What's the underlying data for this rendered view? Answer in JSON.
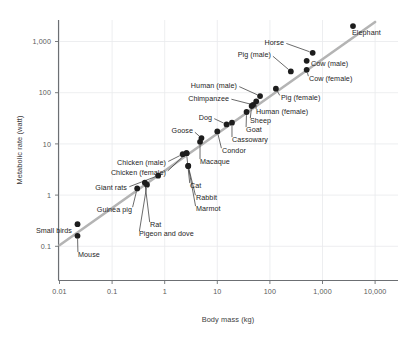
{
  "chart_data": {
    "type": "scatter",
    "title": "",
    "xlabel": "Body mass (kg)",
    "ylabel": "Metabolic rate (watt)",
    "xscale": "log",
    "yscale": "log",
    "xlim": [
      0.01,
      10000
    ],
    "ylim": [
      0.1,
      3000
    ],
    "grid": true,
    "legend": "none",
    "xticks": [
      "0.01",
      "0.1",
      "1",
      "10",
      "100",
      "1,000",
      "10,000"
    ],
    "xtick_values": [
      0.01,
      0.1,
      1,
      10,
      100,
      1000,
      10000
    ],
    "yticks": [
      "1,000",
      "100",
      "10",
      "1",
      "0.1"
    ],
    "ytick_values": [
      1000,
      100,
      10,
      1,
      0.1
    ],
    "trendline": {
      "description": "Kleiber's law power-law fit (slope 3/4 on log-log axes)",
      "x_start": 0.01,
      "y_start": 0.105,
      "x_end": 10000,
      "y_end": 2400
    },
    "points": [
      {
        "label": "Mouse",
        "x": 0.022,
        "y": 0.16,
        "label_side": "right"
      },
      {
        "label": "Small birds",
        "x": 0.022,
        "y": 0.27,
        "label_side": "left"
      },
      {
        "label": "Guinea pig",
        "x": 0.3,
        "y": 1.35,
        "label_side": "left"
      },
      {
        "label": "Rat",
        "x": 0.42,
        "y": 1.75,
        "label_side": "right"
      },
      {
        "label": "Pigeon and dove",
        "x": 0.46,
        "y": 1.6,
        "label_side": "right"
      },
      {
        "label": "Giant rats",
        "x": 0.75,
        "y": 2.4,
        "label_side": "left"
      },
      {
        "label": "Chicken (male)",
        "x": 2.2,
        "y": 6.3,
        "label_side": "left"
      },
      {
        "label": "Chicken (female)",
        "x": 2.6,
        "y": 6.6,
        "label_side": "left"
      },
      {
        "label": "Cat",
        "x": 2.6,
        "y": 6.6,
        "label_side": "right"
      },
      {
        "label": "Marmot",
        "x": 2.8,
        "y": 3.7,
        "label_side": "right"
      },
      {
        "label": "Rabbit",
        "x": 2.8,
        "y": 3.7,
        "label_side": "right"
      },
      {
        "label": "Goose",
        "x": 5.0,
        "y": 13.0,
        "label_side": "left"
      },
      {
        "label": "Macaque",
        "x": 4.7,
        "y": 11.0,
        "label_side": "right"
      },
      {
        "label": "Condor",
        "x": 10.0,
        "y": 17.5,
        "label_side": "right"
      },
      {
        "label": "Dog",
        "x": 15.0,
        "y": 24.0,
        "label_side": "left"
      },
      {
        "label": "Cassowary",
        "x": 19.0,
        "y": 26.0,
        "label_side": "right"
      },
      {
        "label": "Goat",
        "x": 36.0,
        "y": 42.0,
        "label_side": "right"
      },
      {
        "label": "Sheep",
        "x": 45.0,
        "y": 55.0,
        "label_side": "right"
      },
      {
        "label": "Chimpanzee",
        "x": 48.0,
        "y": 58.0,
        "label_side": "left"
      },
      {
        "label": "Human (female)",
        "x": 55.0,
        "y": 68.0,
        "label_side": "right"
      },
      {
        "label": "Human (male)",
        "x": 65.0,
        "y": 86.0,
        "label_side": "left"
      },
      {
        "label": "Pig (female)",
        "x": 130.0,
        "y": 120.0,
        "label_side": "right"
      },
      {
        "label": "Pig (male)",
        "x": 250.0,
        "y": 260.0,
        "label_side": "left"
      },
      {
        "label": "Cow (female)",
        "x": 500.0,
        "y": 280.0,
        "label_side": "right"
      },
      {
        "label": "Cow (male)",
        "x": 500.0,
        "y": 420.0,
        "label_side": "right"
      },
      {
        "label": "Horse",
        "x": 650.0,
        "y": 600.0,
        "label_side": "left"
      },
      {
        "label": "Elephant",
        "x": 3800.0,
        "y": 2000.0,
        "label_side": "right"
      }
    ]
  },
  "colors": {
    "dot": "#1d1d1d",
    "trendline": "#b4b4b4",
    "grid": "#e8eaec",
    "axis": "#6c6f73",
    "text": "#1e1e1e",
    "tick_text": "#5a5a5a",
    "background": "#ffffff"
  },
  "labels": {
    "x_axis_title": "Body mass (kg)",
    "y_axis_title": "Metabolic rate (watt)"
  },
  "annotations": {
    "mouse": "Mouse",
    "small_birds": "Small birds",
    "guinea_pig": "Guinea pig",
    "rat": "Rat",
    "pigeon_and_dove": "Pigeon and dove",
    "giant_rats": "Giant rats",
    "chicken_male": "Chicken (male)",
    "chicken_female": "Chicken (female)",
    "cat": "Cat",
    "rabbit": "Rabbit",
    "marmot": "Marmot",
    "goose": "Goose",
    "macaque": "Macaque",
    "condor": "Condor",
    "dog": "Dog",
    "cassowary": "Cassowary",
    "goat": "Goat",
    "sheep": "Sheep",
    "chimpanzee": "Chimpanzee",
    "human_female": "Human (female)",
    "human_male": "Human (male)",
    "pig_female": "Pig (female)",
    "pig_male": "Pig (male)",
    "cow_female": "Cow (female)",
    "cow_male": "Cow (male)",
    "horse": "Horse",
    "elephant": "Elephant"
  }
}
